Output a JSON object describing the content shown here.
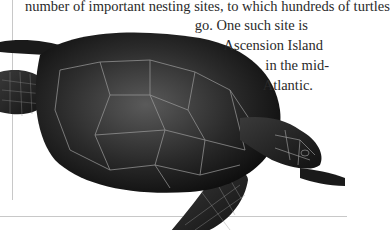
{
  "document": {
    "paragraph_lines": [
      "number of important nesting sites, to which hundreds of turtles",
      "go. One such site is",
      "Ascension Island",
      "in the mid-",
      "Atlantic."
    ]
  },
  "illustration": {
    "subject": "green sea turtle",
    "style": "monochrome engraving"
  }
}
